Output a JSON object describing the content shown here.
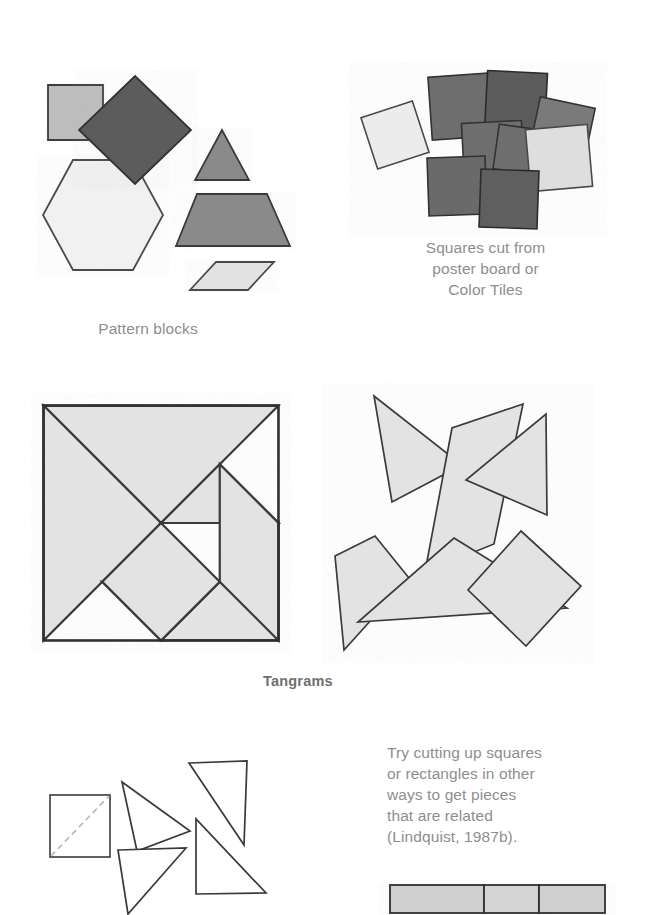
{
  "page": {
    "background": "#ffffff",
    "width": 670,
    "height": 909
  },
  "captions": {
    "pattern_blocks": "Pattern blocks",
    "color_tiles": "Squares cut from\nposter board or\nColor Tiles",
    "tangrams": "Tangrams",
    "cutting_note": "Try cutting up squares\nor rectangles in other\nways to get pieces\nthat are related\n(Lindquist, 1987b)."
  },
  "colors": {
    "text_gray": "#8e8e8e",
    "outline": "#4a4a4a",
    "outline_dark": "#2f2f2f",
    "fill_light": "#ececec",
    "fill_pale": "#f1f1f1",
    "fill_mid_light": "#d7d7d7",
    "fill_mid": "#bdbdbd",
    "fill_gray": "#9a9a9a",
    "fill_dark": "#8a8a8a",
    "fill_darker": "#6e6e6e",
    "fill_darkest": "#5c5c5c",
    "tangram_fill": "#e3e3e3",
    "dash_gray": "#b5b5b5"
  },
  "figures": {
    "pattern_blocks": {
      "label": "Pattern blocks",
      "shapes": [
        {
          "name": "square",
          "fill": "#bdbdbd",
          "points": "8,13 63,13 63,68 8,68"
        },
        {
          "name": "blue-rhombus",
          "fill": "#5c5c5c",
          "points": "83,-9 139,45 83,99 27,45"
        },
        {
          "name": "green-triangle",
          "fill": "#8a8a8a",
          "points": "164,45 191,95 137,95"
        },
        {
          "name": "red-trapezoid",
          "fill": "#8a8a8a",
          "points": "140,109 210,109 233,161 119,161"
        },
        {
          "name": "yellow-hexagon",
          "fill": "#f1f1f1",
          "points": "33,88 93,88 123,143 93,198 33,198 3,143"
        },
        {
          "name": "tan-rhombus",
          "fill": "#e2e2e2",
          "points": "152,177 210,177 184,205 126,205"
        }
      ]
    },
    "color_tiles": {
      "label": "Squares cut from poster board or Color Tiles",
      "tiles": [
        {
          "name": "tile-1",
          "fill": "#ececec",
          "x": 0,
          "y": 36,
          "size": 54,
          "rotate": -18
        },
        {
          "name": "tile-2",
          "fill": "#6e6e6e",
          "x": 62,
          "y": 3,
          "size": 63,
          "rotate": -4
        },
        {
          "name": "tile-3",
          "fill": "#5c5c5c",
          "x": 118,
          "y": 0,
          "size": 60,
          "rotate": 3
        },
        {
          "name": "tile-4",
          "fill": "#7a7a7a",
          "x": 166,
          "y": 30,
          "size": 56,
          "rotate": 12
        },
        {
          "name": "tile-5",
          "fill": "#6e6e6e",
          "x": 95,
          "y": 50,
          "size": 60,
          "rotate": -3
        },
        {
          "name": "tile-6",
          "fill": "#6e6e6e",
          "x": 128,
          "y": 55,
          "size": 45,
          "rotate": 8
        },
        {
          "name": "tile-7",
          "fill": "#dedede",
          "x": 160,
          "y": 55,
          "size": 62,
          "rotate": -5
        },
        {
          "name": "tile-8",
          "fill": "#6a6a6a",
          "x": 60,
          "y": 85,
          "size": 58,
          "rotate": -2
        },
        {
          "name": "tile-9",
          "fill": "#5e5e5e",
          "x": 112,
          "y": 98,
          "size": 58,
          "rotate": 2
        }
      ]
    },
    "tangram_square": {
      "label": "Tangrams",
      "size": 200,
      "pieces": [
        {
          "name": "large-triangle-upper-left",
          "points": "0,0 200,0 100,100"
        },
        {
          "name": "large-triangle-lower-left",
          "points": "0,0 100,100 0,200"
        },
        {
          "name": "medium-triangle",
          "points": "200,100 200,200 100,200"
        },
        {
          "name": "small-triangle-top",
          "points": "100,100 150,50 200,100"
        },
        {
          "name": "small-triangle-center",
          "points": "50,150 100,200 150,150"
        },
        {
          "name": "square-piece",
          "points": "100,100 150,150 100,200 50,150"
        },
        {
          "name": "parallelogram-piece",
          "points": "150,50 200,100 200,200 150,150"
        }
      ]
    },
    "tangram_scattered": {
      "pieces": [
        {
          "name": "scattered-triangle-upper-left",
          "points": "-6,4 82,73 12,110"
        },
        {
          "name": "scattered-parallelogram",
          "points": "143,12 114,152 45,180 72,36"
        },
        {
          "name": "scattered-triangle-right",
          "points": "166,22 167,123 86,88"
        },
        {
          "name": "scattered-arrow-triangle",
          "points": "-5,144 -45,164 -36,258 29,186"
        },
        {
          "name": "scattered-large-triangle",
          "points": "74,146 187,216 -22,230"
        },
        {
          "name": "scattered-square",
          "points": "141,139 201,194 146,254 88,198"
        }
      ]
    },
    "square_cut": {
      "square": {
        "name": "square-with-diagonal",
        "x": 0,
        "y": 0,
        "w": 60,
        "h": 62
      },
      "triangles": [
        {
          "name": "cut-triangle-1",
          "points": "72,36 140,85 87,105"
        },
        {
          "name": "cut-triangle-2",
          "points": "139,17 197,15 194,99"
        },
        {
          "name": "cut-triangle-3",
          "points": "146,115 146,190 216,189"
        },
        {
          "name": "cut-triangle-4",
          "points": "68,128 136,126 78,192"
        }
      ]
    },
    "strip": {
      "name": "segmented-strip",
      "segments": 3,
      "fill": "#cfcfcf"
    }
  }
}
